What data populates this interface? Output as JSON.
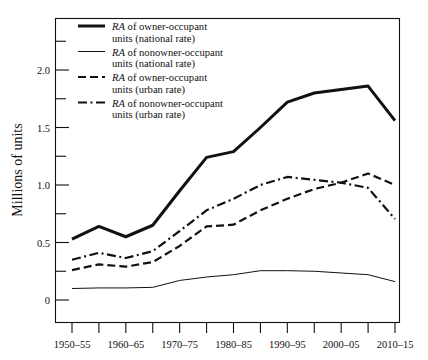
{
  "chart_data": {
    "type": "line",
    "title": "",
    "xlabel": "",
    "ylabel": "Millions of units",
    "ylim": [
      -0.35,
      2.35
    ],
    "yticks_major": [
      0,
      0.5,
      1.0,
      1.5,
      2.0
    ],
    "ytick_labels": [
      "0",
      "0.5",
      "1.0",
      "1.5",
      "2.0"
    ],
    "yticks_minor": [
      0.25,
      0.75,
      1.25,
      1.75,
      2.25
    ],
    "grid": false,
    "legend_position": "top-left-inside",
    "categories": [
      "1950–55",
      "1955–60",
      "1960–65",
      "1965–70",
      "1970–75",
      "1975–80",
      "1980–85",
      "1985–90",
      "1990–95",
      "1995–2000",
      "2000–05",
      "2005–10",
      "2010–15"
    ],
    "xtick_labels_shown": [
      "1950–55",
      "1960–65",
      "1970–75",
      "1980–85",
      "1990–95",
      "2000–05",
      "2010–15"
    ],
    "series": [
      {
        "name": "RA of owner-occupant units (national rate)",
        "style": "solid-thick",
        "values": [
          0.53,
          0.64,
          0.55,
          0.65,
          0.95,
          1.24,
          1.29,
          1.5,
          1.72,
          1.8,
          1.83,
          1.86,
          1.56
        ]
      },
      {
        "name": "RA of nonowner-occupant units (national rate)",
        "style": "solid-thin",
        "values": [
          0.1,
          0.105,
          0.105,
          0.11,
          0.17,
          0.2,
          0.22,
          0.255,
          0.255,
          0.25,
          0.235,
          0.22,
          0.16
        ]
      },
      {
        "name": "RA of owner-occupant units (urban rate)",
        "style": "dashed",
        "values": [
          0.26,
          0.31,
          0.29,
          0.33,
          0.47,
          0.64,
          0.655,
          0.78,
          0.88,
          0.965,
          1.02,
          1.1,
          1.0
        ]
      },
      {
        "name": "RA of nonowner-occupant units (urban rate)",
        "style": "dash-dot",
        "values": [
          0.35,
          0.41,
          0.365,
          0.425,
          0.6,
          0.78,
          0.88,
          1.0,
          1.07,
          1.045,
          1.02,
          0.975,
          0.705
        ]
      }
    ]
  },
  "legend": {
    "items": [
      {
        "prefix": "RA",
        "rest": " of owner-occupant",
        "line2": "units (national rate)",
        "style": "solid-thick"
      },
      {
        "prefix": "RA",
        "rest": " of nonowner-occupant",
        "line2": "units (national rate)",
        "style": "solid-thin"
      },
      {
        "prefix": "RA",
        "rest": " of owner-occupant",
        "line2": "units (urban rate)",
        "style": "dashed"
      },
      {
        "prefix": "RA",
        "rest": " of nonowner-occupant",
        "line2": "units (urban rate)",
        "style": "dash-dot"
      }
    ]
  },
  "colors": {
    "ink": "#111111",
    "background": "#ffffff"
  }
}
